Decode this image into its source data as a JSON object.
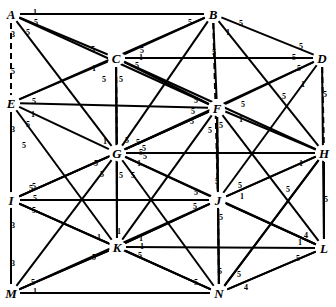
{
  "figure": {
    "background_color": "#ffffff",
    "stroke_color": "#000000",
    "width": 336,
    "height": 307
  },
  "chart_data": {
    "type": "diagram",
    "diagram_kind": "weighted-graph",
    "node_count": 14,
    "edge_count": 75,
    "weight_values": [
      1,
      3,
      4,
      5
    ],
    "nodes": [
      {
        "id": "A",
        "label": "A",
        "x": 11,
        "y": 14
      },
      {
        "id": "B",
        "label": "B",
        "x": 213,
        "y": 14
      },
      {
        "id": "C",
        "label": "C",
        "x": 116,
        "y": 58
      },
      {
        "id": "D",
        "label": "D",
        "x": 322,
        "y": 58
      },
      {
        "id": "E",
        "label": "E",
        "x": 11,
        "y": 103
      },
      {
        "id": "F",
        "label": "F",
        "x": 217,
        "y": 108
      },
      {
        "id": "G",
        "label": "G",
        "x": 117,
        "y": 153
      },
      {
        "id": "H",
        "label": "H",
        "x": 324,
        "y": 153
      },
      {
        "id": "I",
        "label": "I",
        "x": 11,
        "y": 200
      },
      {
        "id": "J",
        "label": "J",
        "x": 218,
        "y": 200
      },
      {
        "id": "K",
        "label": "K",
        "x": 117,
        "y": 247
      },
      {
        "id": "L",
        "label": "L",
        "x": 324,
        "y": 248
      },
      {
        "id": "M",
        "label": "M",
        "x": 11,
        "y": 293
      },
      {
        "id": "N",
        "label": "N",
        "x": 219,
        "y": 293
      }
    ],
    "edges": [
      {
        "from": "A",
        "to": "B",
        "weight": 1,
        "style": "solid",
        "lx": 35,
        "ly": 13
      },
      {
        "from": "A",
        "to": "C",
        "weight": 5,
        "style": "solid",
        "lx": 36,
        "ly": 23
      },
      {
        "from": "A",
        "to": "E",
        "weight": 3,
        "style": "dashed",
        "lx": 13,
        "ly": 35
      },
      {
        "from": "A",
        "to": "G",
        "weight": 5,
        "style": "solid",
        "lx": 28,
        "ly": 33
      },
      {
        "from": "A",
        "to": "F",
        "weight": 5,
        "style": "solid",
        "lx": 93,
        "ly": 50
      },
      {
        "from": "A",
        "to": "I",
        "weight": 5,
        "style": "dashed",
        "lx": 13,
        "ly": 72
      },
      {
        "from": "B",
        "to": "D",
        "weight": 5,
        "style": "solid",
        "lx": 241,
        "ly": 24
      },
      {
        "from": "B",
        "to": "C",
        "weight": 5,
        "style": "solid",
        "lx": 190,
        "ly": 23
      },
      {
        "from": "B",
        "to": "F",
        "weight": 1,
        "style": "solid",
        "lx": 228,
        "ly": 33
      },
      {
        "from": "B",
        "to": "J",
        "weight": 5,
        "style": "dashed",
        "lx": 214,
        "ly": 53
      },
      {
        "from": "B",
        "to": "E",
        "weight": 5,
        "style": "solid",
        "lx": 142,
        "ly": 51
      },
      {
        "from": "B",
        "to": "H",
        "weight": 5,
        "style": "solid",
        "lx": 294,
        "ly": 58
      },
      {
        "from": "C",
        "to": "D",
        "weight": 1,
        "style": "solid",
        "lx": 141,
        "ly": 58
      },
      {
        "from": "C",
        "to": "E",
        "weight": 1,
        "style": "solid",
        "lx": 94,
        "ly": 69
      },
      {
        "from": "C",
        "to": "F",
        "weight": 5,
        "style": "solid",
        "lx": 137,
        "ly": 66
      },
      {
        "from": "C",
        "to": "G",
        "weight": 5,
        "style": "dashed",
        "lx": 121,
        "ly": 80
      },
      {
        "from": "C",
        "to": "K",
        "weight": 5,
        "style": "solid",
        "lx": 104,
        "ly": 80
      },
      {
        "from": "C",
        "to": "H",
        "weight": 5,
        "style": "solid",
        "lx": 301,
        "ly": 47
      },
      {
        "from": "D",
        "to": "H",
        "weight": 5,
        "style": "dashed",
        "lx": 325,
        "ly": 95
      },
      {
        "from": "D",
        "to": "F",
        "weight": 5,
        "style": "solid",
        "lx": 299,
        "ly": 69
      },
      {
        "from": "D",
        "to": "L",
        "weight": 1,
        "style": "solid",
        "lx": 303,
        "ly": 85
      },
      {
        "from": "D",
        "to": "J",
        "weight": 5,
        "style": "solid",
        "lx": 284,
        "ly": 97
      },
      {
        "from": "E",
        "to": "F",
        "weight": 5,
        "style": "solid",
        "lx": 34,
        "ly": 102
      },
      {
        "from": "E",
        "to": "G",
        "weight": 1,
        "style": "solid",
        "lx": 33,
        "ly": 115
      },
      {
        "from": "E",
        "to": "I",
        "weight": 3,
        "style": "dashed",
        "lx": 13,
        "ly": 130
      },
      {
        "from": "E",
        "to": "K",
        "weight": 5,
        "style": "solid",
        "lx": 28,
        "ly": 125
      },
      {
        "from": "E",
        "to": "M",
        "weight": 5,
        "style": "solid",
        "lx": 24,
        "ly": 146
      },
      {
        "from": "F",
        "to": "G",
        "weight": 5,
        "style": "solid",
        "lx": 196,
        "ly": 101
      },
      {
        "from": "F",
        "to": "H",
        "weight": 5,
        "style": "solid",
        "lx": 243,
        "ly": 105
      },
      {
        "from": "F",
        "to": "J",
        "weight": 5,
        "style": "dashed",
        "lx": 221,
        "ly": 126
      },
      {
        "from": "F",
        "to": "K",
        "weight": 5,
        "style": "solid",
        "lx": 193,
        "ly": 112
      },
      {
        "from": "F",
        "to": "L",
        "weight": 1,
        "style": "solid",
        "lx": 241,
        "ly": 120
      },
      {
        "from": "F",
        "to": "I",
        "weight": 5,
        "style": "solid",
        "lx": 192,
        "ly": 122
      },
      {
        "from": "F",
        "to": "N",
        "weight": 5,
        "style": "solid",
        "lx": 210,
        "ly": 131
      },
      {
        "from": "G",
        "to": "H",
        "weight": 5,
        "style": "solid",
        "lx": 141,
        "ly": 153
      },
      {
        "from": "G",
        "to": "I",
        "weight": 5,
        "style": "solid",
        "lx": 96,
        "ly": 164
      },
      {
        "from": "G",
        "to": "J",
        "weight": 1,
        "style": "solid",
        "lx": 139,
        "ly": 164
      },
      {
        "from": "G",
        "to": "K",
        "weight": 5,
        "style": "dashed",
        "lx": 121,
        "ly": 176
      },
      {
        "from": "G",
        "to": "M",
        "weight": 5,
        "style": "solid",
        "lx": 102,
        "ly": 175
      },
      {
        "from": "G",
        "to": "N",
        "weight": 5,
        "style": "solid",
        "lx": 133,
        "ly": 176
      },
      {
        "from": "G",
        "to": "D",
        "weight": 5,
        "style": "solid",
        "lx": 138,
        "ly": 143
      },
      {
        "from": "G",
        "to": "B",
        "weight": 1,
        "style": "solid",
        "lx": 105,
        "ly": 142
      },
      {
        "from": "G",
        "to": "C",
        "weight": 5,
        "style": "solid",
        "lx": 127,
        "ly": 141
      },
      {
        "from": "G",
        "to": "L",
        "weight": 5,
        "style": "solid",
        "lx": 145,
        "ly": 157
      },
      {
        "from": "G",
        "to": "F",
        "weight": 5,
        "style": "solid",
        "lx": 144,
        "ly": 149
      },
      {
        "from": "H",
        "to": "L",
        "weight": 5,
        "style": "dashed",
        "lx": 326,
        "ly": 200
      },
      {
        "from": "H",
        "to": "J",
        "weight": 1,
        "style": "solid",
        "lx": 301,
        "ly": 164
      },
      {
        "from": "H",
        "to": "N",
        "weight": 5,
        "style": "solid",
        "lx": 288,
        "ly": 190
      },
      {
        "from": "I",
        "to": "J",
        "weight": 5,
        "style": "solid",
        "lx": 35,
        "ly": 199
      },
      {
        "from": "I",
        "to": "K",
        "weight": 5,
        "style": "solid",
        "lx": 34,
        "ly": 211
      },
      {
        "from": "I",
        "to": "M",
        "weight": 3,
        "style": "dashed",
        "lx": 13,
        "ly": 226
      },
      {
        "from": "I",
        "to": "N",
        "weight": 5,
        "style": "solid",
        "lx": 31,
        "ly": 189
      },
      {
        "from": "I",
        "to": "G",
        "weight": 5,
        "style": "solid",
        "lx": 34,
        "ly": 187
      },
      {
        "from": "J",
        "to": "K",
        "weight": 5,
        "style": "solid",
        "lx": 196,
        "ly": 193
      },
      {
        "from": "J",
        "to": "L",
        "weight": 1,
        "style": "solid",
        "lx": 242,
        "ly": 197
      },
      {
        "from": "J",
        "to": "N",
        "weight": 5,
        "style": "dashed",
        "lx": 221,
        "ly": 218
      },
      {
        "from": "J",
        "to": "M",
        "weight": 5,
        "style": "solid",
        "lx": 195,
        "ly": 207
      },
      {
        "from": "J",
        "to": "H",
        "weight": 5,
        "style": "solid",
        "lx": 240,
        "ly": 186
      },
      {
        "from": "J",
        "to": "F",
        "weight": 5,
        "style": "solid",
        "lx": 217,
        "ly": 182
      },
      {
        "from": "K",
        "to": "L",
        "weight": 1,
        "style": "solid",
        "lx": 142,
        "ly": 247
      },
      {
        "from": "K",
        "to": "M",
        "weight": 5,
        "style": "solid",
        "lx": 94,
        "ly": 258
      },
      {
        "from": "K",
        "to": "N",
        "weight": 5,
        "style": "solid",
        "lx": 140,
        "ly": 256
      },
      {
        "from": "K",
        "to": "J",
        "weight": 1,
        "style": "solid",
        "lx": 141,
        "ly": 239
      },
      {
        "from": "K",
        "to": "I",
        "weight": 1,
        "style": "solid",
        "lx": 99,
        "ly": 238
      },
      {
        "from": "K",
        "to": "G",
        "weight": 1,
        "style": "solid",
        "lx": 119,
        "ly": 232
      },
      {
        "from": "L",
        "to": "N",
        "weight": 5,
        "style": "solid",
        "lx": 298,
        "ly": 259
      },
      {
        "from": "L",
        "to": "J",
        "weight": 1,
        "style": "solid",
        "lx": 300,
        "ly": 243
      },
      {
        "from": "L",
        "to": "H",
        "weight": 4,
        "style": "solid",
        "lx": 306,
        "ly": 236
      },
      {
        "from": "M",
        "to": "N",
        "weight": 1,
        "style": "solid",
        "lx": 35,
        "ly": 292
      },
      {
        "from": "M",
        "to": "K",
        "weight": 5,
        "style": "solid",
        "lx": 33,
        "ly": 283
      },
      {
        "from": "M",
        "to": "I",
        "weight": 3,
        "style": "dashed",
        "lx": 13,
        "ly": 264
      },
      {
        "from": "N",
        "to": "L",
        "weight": 4,
        "style": "solid",
        "lx": 246,
        "ly": 288
      },
      {
        "from": "N",
        "to": "K",
        "weight": 5,
        "style": "solid",
        "lx": 196,
        "ly": 283
      },
      {
        "from": "N",
        "to": "J",
        "weight": 5,
        "style": "solid",
        "lx": 220,
        "ly": 272
      },
      {
        "from": "N",
        "to": "H",
        "weight": 5,
        "style": "solid",
        "lx": 239,
        "ly": 275
      }
    ]
  }
}
